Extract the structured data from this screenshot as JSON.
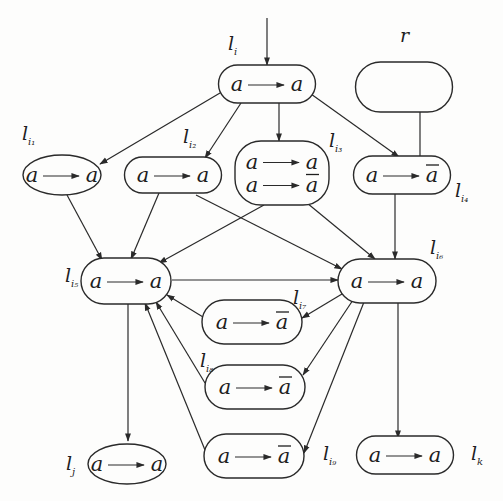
{
  "diagram": {
    "type": "directed-graph",
    "nodes": [
      {
        "id": "li",
        "label_main": "l",
        "label_sub": "i",
        "rules": [
          {
            "lhs": "a",
            "rhs": "a",
            "bar": false
          }
        ]
      },
      {
        "id": "r",
        "label_main": "r",
        "label_sub": "",
        "rules": []
      },
      {
        "id": "li1",
        "label_main": "l",
        "label_sub": "i₁",
        "rules": [
          {
            "lhs": "a",
            "rhs": "a",
            "bar": false
          }
        ]
      },
      {
        "id": "li2",
        "label_main": "l",
        "label_sub": "i₂",
        "rules": [
          {
            "lhs": "a",
            "rhs": "a",
            "bar": false
          }
        ]
      },
      {
        "id": "li3",
        "label_main": "l",
        "label_sub": "i₃",
        "rules": [
          {
            "lhs": "a",
            "rhs": "a",
            "bar": false
          },
          {
            "lhs": "a",
            "rhs": "a",
            "bar": true
          }
        ]
      },
      {
        "id": "li4",
        "label_main": "l",
        "label_sub": "i₄",
        "rules": [
          {
            "lhs": "a",
            "rhs": "a",
            "bar": true
          }
        ]
      },
      {
        "id": "li5",
        "label_main": "l",
        "label_sub": "i₅",
        "rules": [
          {
            "lhs": "a",
            "rhs": "a",
            "bar": false
          }
        ]
      },
      {
        "id": "li6",
        "label_main": "l",
        "label_sub": "i₆",
        "rules": [
          {
            "lhs": "a",
            "rhs": "a",
            "bar": false
          }
        ]
      },
      {
        "id": "li7",
        "label_main": "l",
        "label_sub": "i₇",
        "rules": [
          {
            "lhs": "a",
            "rhs": "a",
            "bar": true
          }
        ]
      },
      {
        "id": "li8",
        "label_main": "l",
        "label_sub": "i₈",
        "rules": [
          {
            "lhs": "a",
            "rhs": "a",
            "bar": true
          }
        ]
      },
      {
        "id": "li9",
        "label_main": "l",
        "label_sub": "i₉",
        "rules": [
          {
            "lhs": "a",
            "rhs": "a",
            "bar": true
          }
        ]
      },
      {
        "id": "lj",
        "label_main": "l",
        "label_sub": "j",
        "rules": [
          {
            "lhs": "a",
            "rhs": "a",
            "bar": false
          }
        ]
      },
      {
        "id": "lk",
        "label_main": "l",
        "label_sub": "k",
        "rules": [
          {
            "lhs": "a",
            "rhs": "a",
            "bar": false
          }
        ]
      }
    ],
    "edges": [
      {
        "from": "start",
        "to": "li"
      },
      {
        "from": "li",
        "to": "li1"
      },
      {
        "from": "li",
        "to": "li2"
      },
      {
        "from": "li",
        "to": "li3"
      },
      {
        "from": "li",
        "to": "li4"
      },
      {
        "from": "li4",
        "to": "r"
      },
      {
        "from": "li1",
        "to": "li5"
      },
      {
        "from": "li2",
        "to": "li5"
      },
      {
        "from": "li2",
        "to": "li6"
      },
      {
        "from": "li3",
        "to": "li5"
      },
      {
        "from": "li3",
        "to": "li6"
      },
      {
        "from": "li4",
        "to": "li6"
      },
      {
        "from": "li5",
        "to": "li6"
      },
      {
        "from": "li6",
        "to": "li7"
      },
      {
        "from": "li6",
        "to": "li8"
      },
      {
        "from": "li6",
        "to": "li9"
      },
      {
        "from": "li7",
        "to": "li5"
      },
      {
        "from": "li8",
        "to": "li5"
      },
      {
        "from": "li9",
        "to": "li5"
      },
      {
        "from": "li5",
        "to": "lj"
      },
      {
        "from": "li6",
        "to": "lk"
      }
    ]
  }
}
